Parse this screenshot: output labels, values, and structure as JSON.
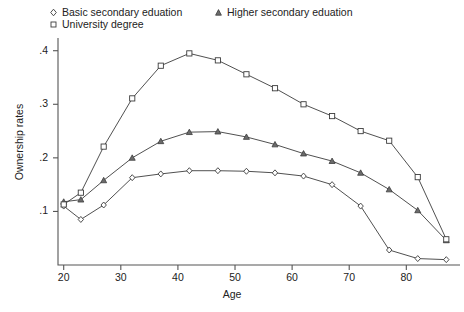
{
  "chart_data": {
    "type": "line",
    "title": "",
    "xlabel": "Age",
    "ylabel": "Ownership rates",
    "xlim": [
      19,
      88
    ],
    "ylim": [
      0,
      0.42
    ],
    "xticks": [
      20,
      30,
      40,
      50,
      60,
      70,
      80
    ],
    "xtick_labels": [
      "20",
      "30",
      "40",
      "50",
      "60",
      "70",
      "80"
    ],
    "yticks": [
      0.1,
      0.2,
      0.3,
      0.4
    ],
    "ytick_labels": [
      ".1",
      ".2",
      ".3",
      ".4"
    ],
    "grid": false,
    "legend_position": "top",
    "line_color": "#3c3c3c",
    "series": [
      {
        "name": "Basic secondary eduation",
        "marker": "diamond",
        "x": [
          20,
          23,
          27,
          32,
          37,
          42,
          47,
          52,
          57,
          62,
          67,
          72,
          77,
          82,
          87
        ],
        "values": [
          0.11,
          0.085,
          0.112,
          0.163,
          0.17,
          0.176,
          0.176,
          0.175,
          0.172,
          0.166,
          0.15,
          0.11,
          0.028,
          0.012,
          0.01
        ]
      },
      {
        "name": "Higher secondary eduation",
        "marker": "triangle",
        "x": [
          20,
          23,
          27,
          32,
          37,
          42,
          47,
          52,
          57,
          62,
          67,
          72,
          77,
          82,
          87
        ],
        "values": [
          0.118,
          0.122,
          0.158,
          0.2,
          0.231,
          0.248,
          0.249,
          0.239,
          0.225,
          0.208,
          0.194,
          0.172,
          0.141,
          0.102,
          0.046
        ]
      },
      {
        "name": "University degree",
        "marker": "square",
        "x": [
          20,
          23,
          27,
          32,
          37,
          42,
          47,
          52,
          57,
          62,
          67,
          72,
          77,
          82,
          87
        ],
        "values": [
          0.113,
          0.135,
          0.221,
          0.311,
          0.372,
          0.395,
          0.382,
          0.356,
          0.33,
          0.3,
          0.278,
          0.25,
          0.232,
          0.164,
          0.048
        ]
      }
    ]
  },
  "legend": {
    "entries": [
      {
        "label": "Basic secondary eduation",
        "marker": "diamond"
      },
      {
        "label": "University degree",
        "marker": "square"
      },
      {
        "label": "Higher secondary eduation",
        "marker": "triangle"
      }
    ]
  },
  "axes": {
    "x_label": "Age",
    "y_label": "Ownership rates"
  }
}
